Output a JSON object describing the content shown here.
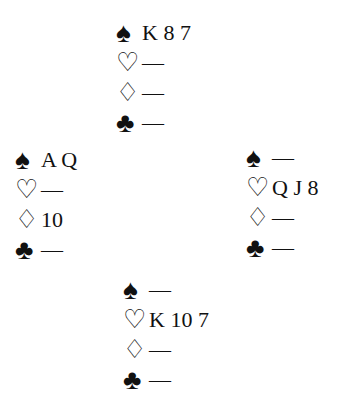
{
  "suits": {
    "spades": "♠",
    "hearts": "♡",
    "diamonds": "♢",
    "clubs": "♣"
  },
  "hands": {
    "north": {
      "spades": "K 8 7",
      "hearts": "—",
      "diamonds": "—",
      "clubs": "—"
    },
    "west": {
      "spades": "A Q",
      "hearts": "—",
      "diamonds": "10",
      "clubs": "—"
    },
    "east": {
      "spades": "—",
      "hearts": "Q J 8",
      "diamonds": "—",
      "clubs": "—"
    },
    "south": {
      "spades": "—",
      "hearts": "K 10 7",
      "diamonds": "—",
      "clubs": "—"
    }
  }
}
